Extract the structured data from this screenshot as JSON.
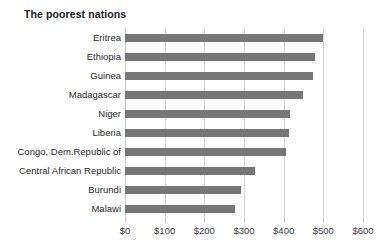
{
  "chart_data": {
    "type": "bar",
    "orientation": "horizontal",
    "title": "The poorest nations",
    "xlabel": "",
    "ylabel": "",
    "categories": [
      "Eritrea",
      "Ethiopia",
      "Guinea",
      "Madagascar",
      "Niger",
      "Liberia",
      "Congo, Dem.Republic of",
      "Central African Republic",
      "Burundi",
      "Malawi"
    ],
    "values": [
      500,
      480,
      473,
      448,
      415,
      413,
      406,
      327,
      293,
      277
    ],
    "xlim": [
      0,
      600
    ],
    "xticks": [
      0,
      100,
      200,
      300,
      400,
      500,
      600
    ],
    "xtick_labels": [
      "$0",
      "$100",
      "$200",
      "$300",
      "$400",
      "$500",
      "$600"
    ],
    "grid": true,
    "legend": null,
    "bar_color": "#767676",
    "gridline_color": "#d6d6d6",
    "title_color": "#1a1a1a",
    "label_color": "#2b2b2b"
  }
}
